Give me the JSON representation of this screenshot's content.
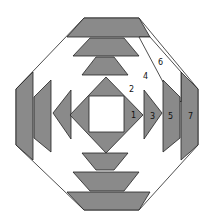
{
  "diagram": {
    "colors": {
      "dark": "#8a8a8a",
      "light": "#ffffff",
      "outline": "#222222"
    },
    "labels": [
      {
        "id": "1",
        "text": "1"
      },
      {
        "id": "2",
        "text": "2"
      },
      {
        "id": "3",
        "text": "3"
      },
      {
        "id": "4",
        "text": "4"
      },
      {
        "id": "5",
        "text": "5"
      },
      {
        "id": "6",
        "text": "6"
      },
      {
        "id": "7",
        "text": "7"
      }
    ]
  }
}
